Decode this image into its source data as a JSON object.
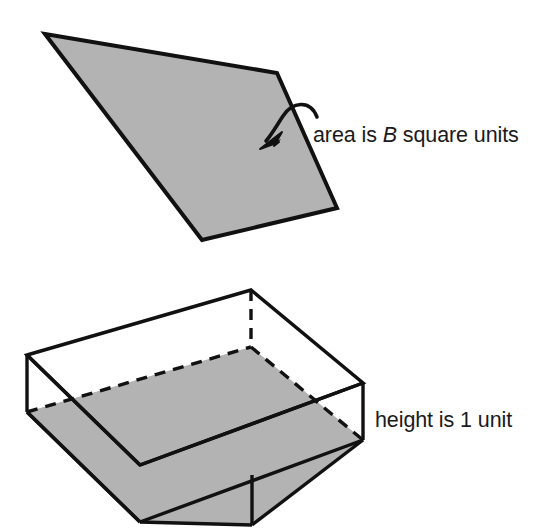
{
  "figure": {
    "background_color": "#ffffff",
    "stroke_color": "#111111",
    "fill_gray": "#b3b3b3",
    "labels": {
      "area_label_part1": "area is ",
      "area_label_variable": "B",
      "area_label_part2": " square units",
      "height_label": "height is 1 unit"
    },
    "top_region": {
      "name": "shaded quadrilateral region",
      "fill": "#b3b3b3",
      "stroke": "#111111",
      "vertices": [
        [
          45,
          34
        ],
        [
          277,
          73
        ],
        [
          337,
          208
        ],
        [
          202,
          240
        ]
      ]
    },
    "arrow": {
      "name": "curved pointer from area label to region",
      "start": [
        318,
        118
      ],
      "end": [
        263,
        144
      ]
    },
    "prism": {
      "name": "rectangular box of height 1 unit containing shaded slab",
      "top_face_vertices": [
        [
          27,
          355
        ],
        [
          251,
          290
        ],
        [
          363,
          383
        ],
        [
          140,
          465
        ]
      ],
      "bottom_face_vertices": [
        [
          27,
          412
        ],
        [
          251,
          347
        ],
        [
          363,
          440
        ],
        [
          140,
          522
        ]
      ],
      "slab_top_face_vertices": [
        [
          27,
          412
        ],
        [
          251,
          347
        ],
        [
          363,
          440
        ],
        [
          140,
          522
        ]
      ],
      "front_vertex": [
        252,
        475
      ],
      "bottom_front_vertex": [
        252,
        525
      ],
      "hidden_edges": "dashed",
      "height_units": 1
    }
  }
}
